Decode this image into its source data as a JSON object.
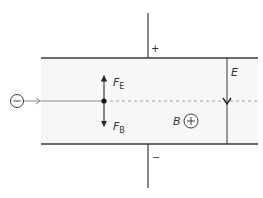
{
  "diagram": {
    "colors": {
      "line": "#3a3a3a",
      "field_region": "#f7f7f7",
      "beam": "#8a8a8a",
      "dashed": "#9a9a9a",
      "background": "#ffffff"
    },
    "plates": {
      "top_polarity": "+",
      "bottom_polarity": "−"
    },
    "particle": {
      "charge_symbol": "−"
    },
    "forces": {
      "electric": {
        "symbol": "F",
        "subscript": "E",
        "direction": "up"
      },
      "magnetic": {
        "symbol": "F",
        "subscript": "B",
        "direction": "down"
      }
    },
    "fields": {
      "electric": {
        "label": "E",
        "direction": "down"
      },
      "magnetic": {
        "label": "B",
        "symbol": "+",
        "direction": "into page"
      }
    }
  }
}
